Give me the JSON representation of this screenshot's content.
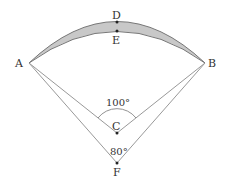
{
  "diagram": {
    "points": {
      "A": {
        "label": "A",
        "x": 29,
        "y": 63
      },
      "B": {
        "label": "B",
        "x": 205,
        "y": 63
      },
      "C": {
        "label": "C",
        "x": 117,
        "y": 133
      },
      "D": {
        "label": "D",
        "x": 117,
        "y": 22
      },
      "E": {
        "label": "E",
        "x": 117,
        "y": 31
      },
      "F": {
        "label": "F",
        "x": 117,
        "y": 163
      }
    },
    "angles": {
      "ACB": "100°",
      "AFB": "80°"
    },
    "colors": {
      "line": "#888888",
      "shade": "#c8c8c8",
      "text": "#333333"
    }
  }
}
